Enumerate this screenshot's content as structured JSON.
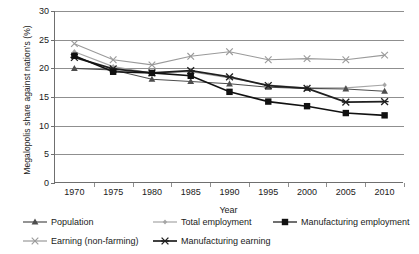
{
  "chart_data": {
    "type": "line",
    "title": "",
    "xlabel": "Year",
    "ylabel": "Megalopolis share against nation's (%)",
    "x": [
      1970,
      1975,
      1980,
      1985,
      1990,
      1995,
      2000,
      2005,
      2010
    ],
    "xtick_labels": [
      "1970",
      "1975",
      "1980",
      "1985",
      "1990",
      "1995",
      "2000",
      "2005",
      "2010"
    ],
    "ytick_labels": [
      "0",
      "5",
      "10",
      "15",
      "20",
      "25",
      "30"
    ],
    "ytick_values": [
      0,
      5,
      10,
      15,
      20,
      25,
      30
    ],
    "xlim": [
      1967.5,
      2012.5
    ],
    "ylim": [
      0,
      30
    ],
    "grid": "horizontal",
    "legend_position": "bottom",
    "series": [
      {
        "name": "Population",
        "marker": "triangle",
        "color": "#4d4d4d",
        "values": [
          20.0,
          19.7,
          18.1,
          17.7,
          17.3,
          16.7,
          16.5,
          16.4,
          16.0
        ]
      },
      {
        "name": "Total employment",
        "marker": "small-diamond",
        "color": "#a6a6a6",
        "values": [
          22.9,
          20.3,
          19.2,
          19.4,
          18.3,
          17.1,
          16.6,
          16.6,
          17.1
        ]
      },
      {
        "name": "Manufacturing employment",
        "marker": "filled-square",
        "color": "#111111",
        "values": [
          22.2,
          19.4,
          19.2,
          18.7,
          15.9,
          14.2,
          13.4,
          12.2,
          11.8
        ]
      },
      {
        "name": "Earning (non-farming)",
        "marker": "cross-x",
        "color": "#9a9a9a",
        "values": [
          24.3,
          21.5,
          20.6,
          22.1,
          22.9,
          21.5,
          21.7,
          21.5,
          22.3
        ]
      },
      {
        "name": "Manufacturing earning",
        "marker": "asterisk",
        "color": "#1f1f1f",
        "values": [
          21.9,
          19.9,
          19.2,
          19.6,
          18.5,
          17.0,
          16.5,
          14.1,
          14.2
        ]
      }
    ]
  }
}
